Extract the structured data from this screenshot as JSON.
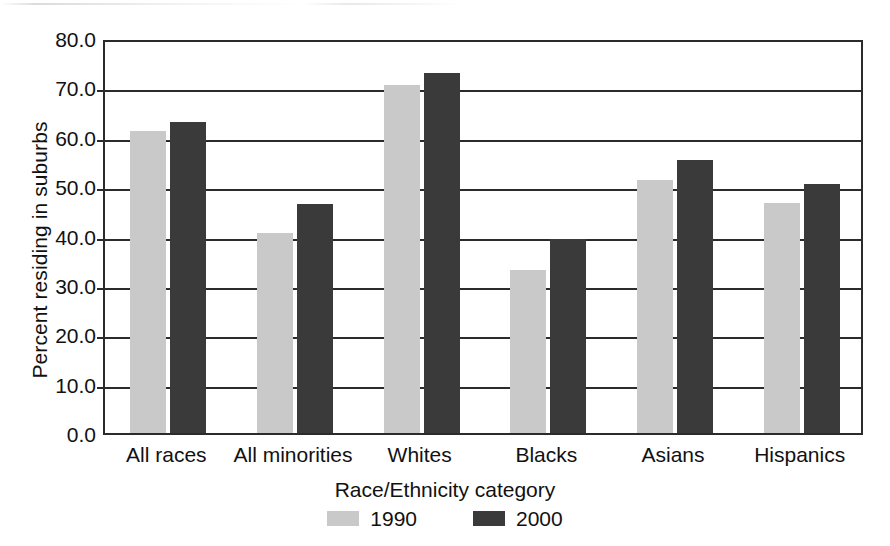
{
  "chart_data": {
    "type": "bar",
    "title": "",
    "xlabel": "Race/Ethnicity category",
    "ylabel": "Percent residing in suburbs",
    "categories": [
      "All races",
      "All minorities",
      "Whites",
      "Blacks",
      "Asians",
      "Hispanics"
    ],
    "series": [
      {
        "name": "1990",
        "color": "#c9c9c9",
        "values": [
          61.2,
          40.6,
          70.4,
          33.1,
          51.2,
          46.6
        ]
      },
      {
        "name": "2000",
        "color": "#3a3a3a",
        "values": [
          63.0,
          46.4,
          73.0,
          39.3,
          55.2,
          50.4
        ]
      }
    ],
    "ylim": [
      0.0,
      80.0
    ],
    "ytick_values": [
      0.0,
      10.0,
      20.0,
      30.0,
      40.0,
      50.0,
      60.0,
      70.0,
      80.0
    ],
    "ytick_labels": [
      "0.0",
      "10.0",
      "20.0",
      "30.0",
      "40.0",
      "50.0",
      "60.0",
      "70.0",
      "80.0"
    ],
    "grid": true,
    "grid_axis": "y",
    "legend_position": "bottom",
    "legend_entries": [
      "1990",
      "2000"
    ]
  },
  "figure": {
    "background_color": "#ffffff",
    "axis_color": "#2b2b2b",
    "text_color": "#111111"
  }
}
